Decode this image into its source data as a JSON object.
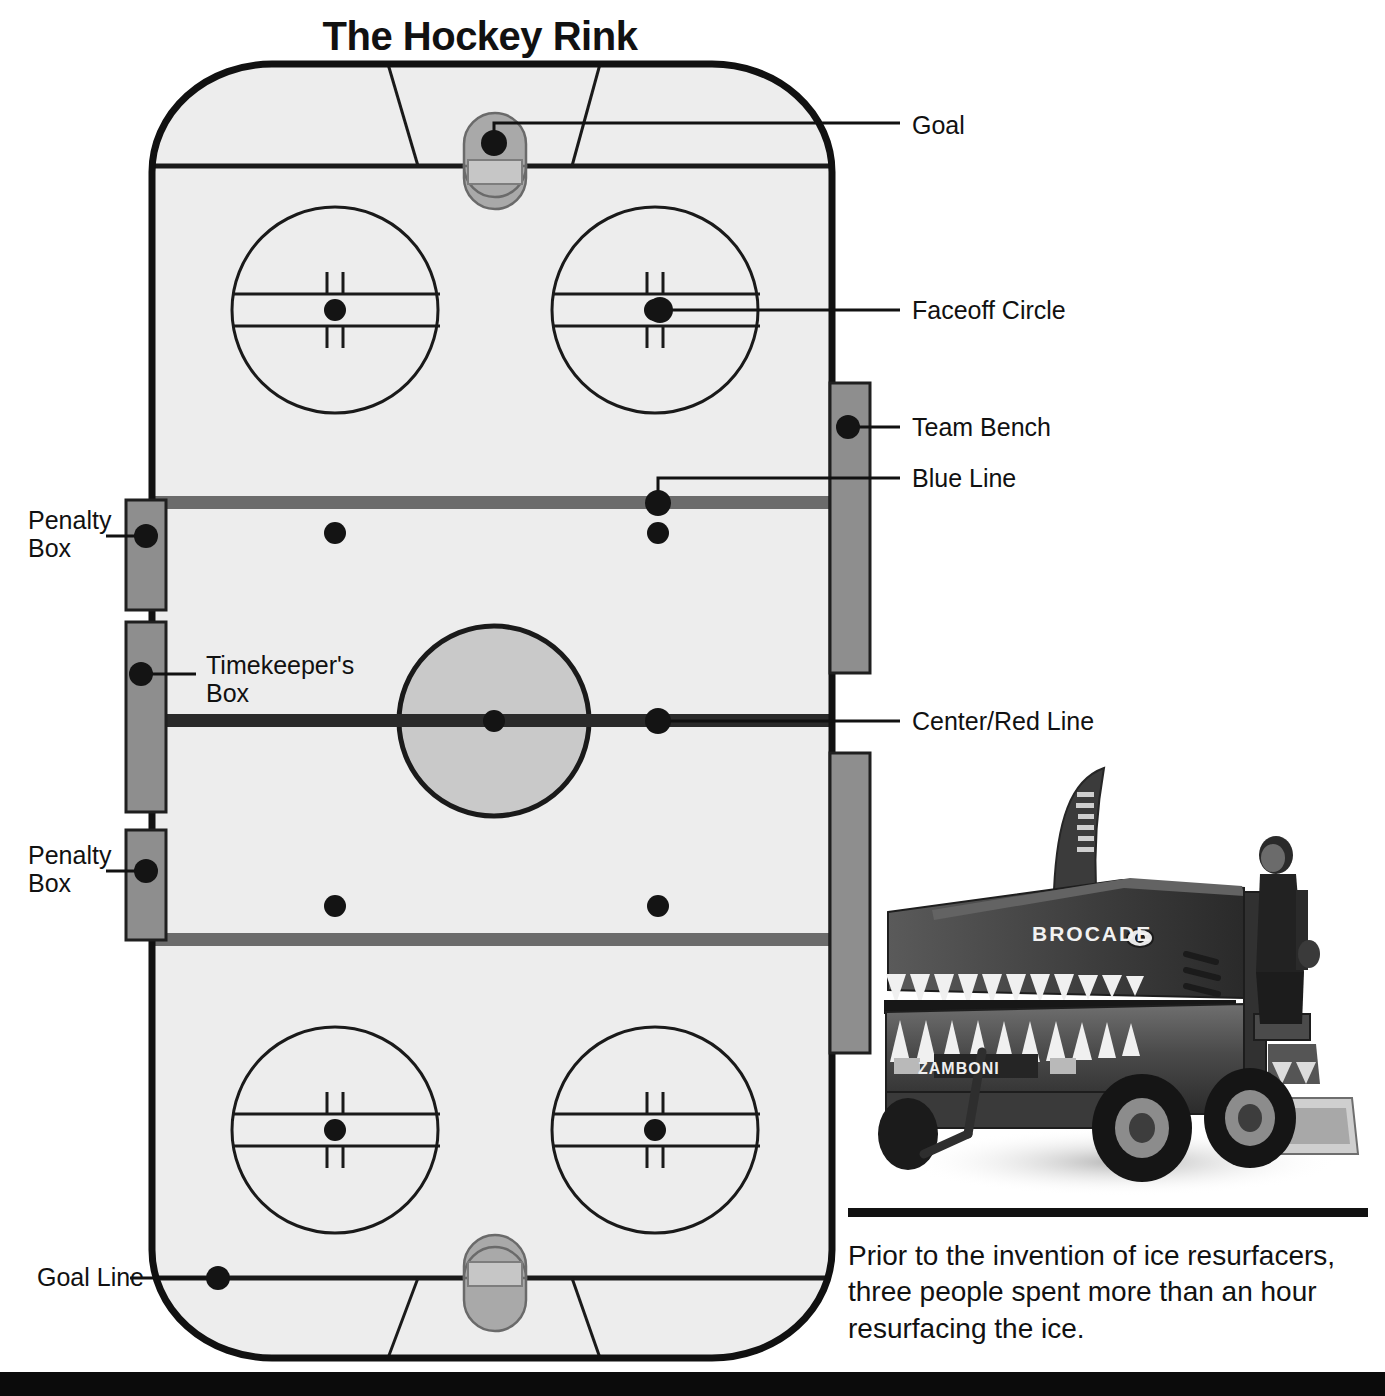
{
  "title": "The Hockey Rink",
  "colors": {
    "ice": "#ededed",
    "ice_edge": "#111111",
    "line_dark": "#1a1a1a",
    "blue_line": "#6b6b6b",
    "red_line": "#2a2a2a",
    "box_fill": "#8e8e8e",
    "box_border": "#1f1f1f",
    "crease_fill": "#a9a9a9",
    "center_circle_fill": "#c9c9c9",
    "dot": "#141414",
    "caption_rule": "#111111",
    "bottom_bar": "#0b0b0b"
  },
  "labels": {
    "right": [
      {
        "id": "goal",
        "text": "Goal"
      },
      {
        "id": "faceoff-circle",
        "text": "Faceoff Circle"
      },
      {
        "id": "team-bench",
        "text": "Team Bench"
      },
      {
        "id": "blue-line",
        "text": "Blue Line"
      },
      {
        "id": "center-red-line",
        "text": "Center/Red Line"
      }
    ],
    "left": [
      {
        "id": "penalty-box-upper",
        "text": "Penalty\nBox"
      },
      {
        "id": "timekeepers-box",
        "text": "Timekeeper's\nBox"
      },
      {
        "id": "penalty-box-lower",
        "text": "Penalty\nBox"
      },
      {
        "id": "goal-line",
        "text": "Goal Line"
      }
    ]
  },
  "photo": {
    "subject": "shark-themed ice resurfacer",
    "vehicle_brand": "ZAMBONI",
    "sponsor_text": "BROCADE"
  },
  "caption": {
    "line1": "Prior to the invention of ice resurfacers,",
    "line2": "three people spent more than an hour",
    "line3": "resurfacing the ice.",
    "full": "Prior to the invention of ice resurfacers, three people spent more than an hour resurfacing the ice."
  },
  "rink": {
    "features": [
      "goal-net-top",
      "goal-crease-top",
      "goal-line-top",
      "faceoff-circle-top-left",
      "faceoff-circle-top-right",
      "blue-line-top",
      "neutral-zone-dots",
      "center-circle",
      "center-red-line",
      "blue-line-bottom",
      "faceoff-circle-bottom-left",
      "faceoff-circle-bottom-right",
      "goal-line-bottom",
      "goal-crease-bottom",
      "goal-net-bottom",
      "penalty-box-upper",
      "timekeepers-box",
      "penalty-box-lower",
      "team-bench-upper",
      "team-bench-lower"
    ]
  }
}
